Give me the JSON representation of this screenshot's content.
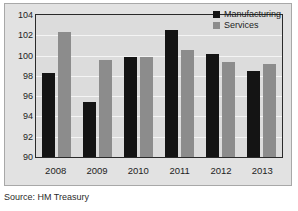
{
  "chart_data": {
    "type": "bar",
    "title": "",
    "subtitle": "",
    "xlabel": "",
    "ylabel": "",
    "categories": [
      "2008",
      "2009",
      "2010",
      "2011",
      "2012",
      "2013"
    ],
    "series": [
      {
        "name": "Manufacturing",
        "color": "#141414",
        "values": [
          98.3,
          95.4,
          99.9,
          102.5,
          100.2,
          98.5
        ]
      },
      {
        "name": "Services",
        "color": "#8c8c8c",
        "values": [
          102.3,
          99.6,
          99.9,
          100.6,
          99.4,
          99.2
        ]
      }
    ],
    "ylim": [
      90,
      104
    ],
    "yticks": [
      "104",
      "102",
      "100",
      "98",
      "96",
      "94",
      "92",
      "90"
    ],
    "ytick_values": [
      104,
      102,
      100,
      98,
      96,
      94,
      92,
      90
    ],
    "grid": "horizontal",
    "legend_position": "top-right",
    "plot_background": "#dcdcdc",
    "panel_background": "#e2e2e2",
    "gridline_color": "#f4f4f4"
  },
  "legend": {
    "entries": [
      {
        "label": "Manufacturing"
      },
      {
        "label": "Services"
      }
    ]
  },
  "caption": {
    "source": "Source: HM Treasury"
  }
}
